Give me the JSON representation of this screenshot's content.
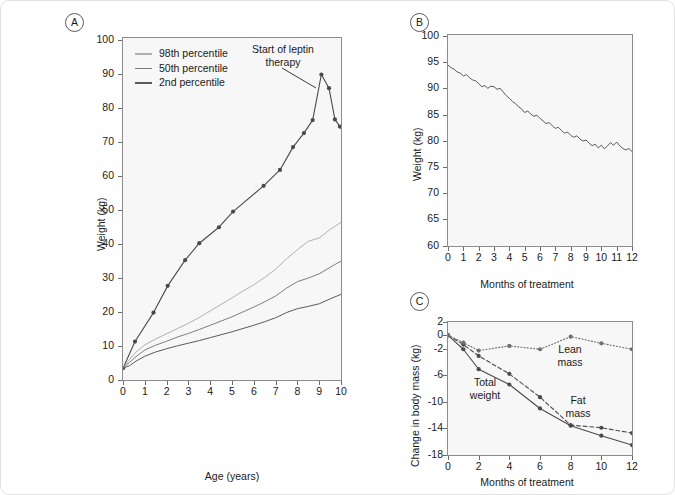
{
  "figure": {
    "background": "#ffffff",
    "plot_background": "#f7f7f7",
    "axis_color": "#8c8c8c",
    "series_dark_color": "#4a4a4a",
    "series_mid_color": "#7d7d7d",
    "series_light_color": "#b0b0b0"
  },
  "panels": {
    "a": {
      "tag": "A",
      "xlabel": "Age (years)",
      "ylabel": "Weight (kg)",
      "yticks": [
        "0",
        "10",
        "20",
        "30",
        "40",
        "50",
        "60",
        "70",
        "80",
        "90",
        "100"
      ],
      "xticks": [
        "0",
        "1",
        "2",
        "3",
        "4",
        "5",
        "6",
        "7",
        "8",
        "9",
        "10"
      ],
      "legend": [
        {
          "label": "98th percentile",
          "color": "#b0b0b0"
        },
        {
          "label": "50th percentile",
          "color": "#7d7d7d"
        },
        {
          "label": "2nd percentile",
          "color": "#5a5a5a"
        }
      ],
      "annotation": {
        "line1": "Start of leptin",
        "line2": "therapy"
      }
    },
    "b": {
      "tag": "B",
      "xlabel": "Months of treatment",
      "ylabel": "Weight (kg)",
      "yticks": [
        "60",
        "65",
        "70",
        "75",
        "80",
        "85",
        "90",
        "95",
        "100"
      ],
      "xticks": [
        "0",
        "1",
        "2",
        "3",
        "4",
        "5",
        "6",
        "7",
        "8",
        "9",
        "10",
        "11",
        "12"
      ]
    },
    "c": {
      "tag": "C",
      "xlabel": "Months of treatment",
      "ylabel": "Change in body mass (kg)",
      "yticks": [
        "-18",
        "-14",
        "-10",
        "-6",
        "-2",
        "0",
        "2"
      ],
      "xticks": [
        "0",
        "2",
        "4",
        "6",
        "8",
        "10",
        "12"
      ],
      "inline_labels": {
        "total_weight": {
          "line1": "Total",
          "line2": "weight"
        },
        "lean_mass": {
          "line1": "Lean",
          "line2": "mass"
        },
        "fat_mass": {
          "line1": "Fat",
          "line2": "mass"
        }
      }
    }
  },
  "chart_data": [
    {
      "type": "line",
      "panel": "A",
      "title": "",
      "xlabel": "Age (years)",
      "ylabel": "Weight (kg)",
      "xlim": [
        0,
        10
      ],
      "ylim": [
        0,
        105
      ],
      "grid": false,
      "legend_position": "top-left",
      "series": [
        {
          "name": "Patient weight",
          "color": "#4a4a4a",
          "markers": true,
          "style": "solid",
          "points": [
            [
              0.0,
              3.6
            ],
            [
              0.55,
              11.8
            ],
            [
              1.4,
              20.7
            ],
            [
              2.05,
              28.9
            ],
            [
              2.85,
              36.8
            ],
            [
              3.5,
              42.0
            ],
            [
              4.4,
              46.9
            ],
            [
              5.05,
              51.7
            ],
            [
              6.45,
              59.6
            ],
            [
              7.2,
              64.5
            ],
            [
              7.8,
              71.5
            ],
            [
              8.3,
              75.8
            ],
            [
              8.7,
              79.8
            ],
            [
              9.1,
              93.8
            ],
            [
              9.45,
              89.6
            ],
            [
              9.72,
              80.0
            ],
            [
              9.95,
              77.8
            ]
          ]
        },
        {
          "name": "98th percentile",
          "color": "#b0b0b0",
          "markers": false,
          "style": "solid",
          "points": [
            [
              0.0,
              3.6
            ],
            [
              0.3,
              6.3
            ],
            [
              0.6,
              8.6
            ],
            [
              1.0,
              10.8
            ],
            [
              1.5,
              12.6
            ],
            [
              2.0,
              14.2
            ],
            [
              2.5,
              15.8
            ],
            [
              3.0,
              17.4
            ],
            [
              3.5,
              19.2
            ],
            [
              4.0,
              21.2
            ],
            [
              4.5,
              23.2
            ],
            [
              5.0,
              25.2
            ],
            [
              5.5,
              27.3
            ],
            [
              6.0,
              29.2
            ],
            [
              6.5,
              31.5
            ],
            [
              7.0,
              34.0
            ],
            [
              7.5,
              37.2
            ],
            [
              8.0,
              40.0
            ],
            [
              8.5,
              42.6
            ],
            [
              9.0,
              43.6
            ],
            [
              9.5,
              46.2
            ],
            [
              10.0,
              48.4
            ]
          ]
        },
        {
          "name": "50th percentile",
          "color": "#7d7d7d",
          "markers": false,
          "style": "solid",
          "points": [
            [
              0.0,
              3.6
            ],
            [
              0.3,
              5.4
            ],
            [
              0.6,
              7.2
            ],
            [
              1.0,
              9.2
            ],
            [
              1.5,
              10.7
            ],
            [
              2.0,
              11.9
            ],
            [
              2.5,
              13.2
            ],
            [
              3.0,
              14.3
            ],
            [
              3.5,
              15.5
            ],
            [
              4.0,
              16.8
            ],
            [
              4.5,
              18.1
            ],
            [
              5.0,
              19.4
            ],
            [
              5.5,
              20.9
            ],
            [
              6.0,
              22.4
            ],
            [
              6.5,
              24.0
            ],
            [
              7.0,
              25.8
            ],
            [
              7.5,
              28.2
            ],
            [
              8.0,
              30.2
            ],
            [
              8.5,
              31.3
            ],
            [
              9.0,
              32.6
            ],
            [
              9.5,
              34.6
            ],
            [
              10.0,
              36.5
            ]
          ]
        },
        {
          "name": "2nd percentile",
          "color": "#5a5a5a",
          "markers": false,
          "style": "solid",
          "points": [
            [
              0.0,
              3.6
            ],
            [
              0.3,
              4.4
            ],
            [
              0.6,
              5.8
            ],
            [
              1.0,
              7.3
            ],
            [
              1.5,
              8.6
            ],
            [
              2.0,
              9.6
            ],
            [
              2.5,
              10.5
            ],
            [
              3.0,
              11.3
            ],
            [
              3.5,
              12.1
            ],
            [
              4.0,
              13.0
            ],
            [
              4.5,
              13.9
            ],
            [
              5.0,
              14.8
            ],
            [
              5.5,
              15.8
            ],
            [
              6.0,
              16.8
            ],
            [
              6.5,
              17.9
            ],
            [
              7.0,
              19.1
            ],
            [
              7.5,
              20.7
            ],
            [
              8.0,
              21.9
            ],
            [
              8.5,
              22.6
            ],
            [
              9.0,
              23.4
            ],
            [
              9.5,
              24.9
            ],
            [
              10.0,
              26.3
            ]
          ]
        }
      ],
      "annotations": [
        {
          "text": "Start of leptin therapy",
          "at": [
            9.1,
            93.8
          ]
        }
      ]
    },
    {
      "type": "line",
      "panel": "B",
      "title": "",
      "xlabel": "Months of treatment",
      "ylabel": "Weight (kg)",
      "xlim": [
        0,
        12
      ],
      "ylim": [
        60,
        100
      ],
      "grid": false,
      "series": [
        {
          "name": "Weight during leptin therapy",
          "color": "#5a5a5a",
          "markers": false,
          "style": "solid",
          "points": [
            [
              0.0,
              94.3
            ],
            [
              0.2,
              93.8
            ],
            [
              0.4,
              93.5
            ],
            [
              0.6,
              93.0
            ],
            [
              0.8,
              92.8
            ],
            [
              1.0,
              92.2
            ],
            [
              1.2,
              92.5
            ],
            [
              1.4,
              91.9
            ],
            [
              1.6,
              91.5
            ],
            [
              1.8,
              91.3
            ],
            [
              2.0,
              90.8
            ],
            [
              2.2,
              90.2
            ],
            [
              2.4,
              90.4
            ],
            [
              2.6,
              89.9
            ],
            [
              2.8,
              90.3
            ],
            [
              3.0,
              90.2
            ],
            [
              3.2,
              89.7
            ],
            [
              3.4,
              89.9
            ],
            [
              3.6,
              89.2
            ],
            [
              3.8,
              88.5
            ],
            [
              4.0,
              88.0
            ],
            [
              4.2,
              87.4
            ],
            [
              4.4,
              87.0
            ],
            [
              4.6,
              86.4
            ],
            [
              4.8,
              86.0
            ],
            [
              5.0,
              85.3
            ],
            [
              5.2,
              85.6
            ],
            [
              5.4,
              85.0
            ],
            [
              5.6,
              84.6
            ],
            [
              5.8,
              84.8
            ],
            [
              6.0,
              84.2
            ],
            [
              6.2,
              83.7
            ],
            [
              6.4,
              83.2
            ],
            [
              6.6,
              83.4
            ],
            [
              6.8,
              82.8
            ],
            [
              7.0,
              82.3
            ],
            [
              7.2,
              82.5
            ],
            [
              7.4,
              81.9
            ],
            [
              7.6,
              81.4
            ],
            [
              7.8,
              81.6
            ],
            [
              8.0,
              81.0
            ],
            [
              8.2,
              80.6
            ],
            [
              8.4,
              80.9
            ],
            [
              8.6,
              80.3
            ],
            [
              8.8,
              79.9
            ],
            [
              9.0,
              80.1
            ],
            [
              9.2,
              79.5
            ],
            [
              9.4,
              79.0
            ],
            [
              9.6,
              79.3
            ],
            [
              9.8,
              78.6
            ],
            [
              10.0,
              79.1
            ],
            [
              10.2,
              78.4
            ],
            [
              10.4,
              79.0
            ],
            [
              10.6,
              79.6
            ],
            [
              10.8,
              79.1
            ],
            [
              11.0,
              79.7
            ],
            [
              11.2,
              79.0
            ],
            [
              11.4,
              78.5
            ],
            [
              11.6,
              78.2
            ],
            [
              11.8,
              78.5
            ],
            [
              12.0,
              77.9
            ]
          ]
        }
      ]
    },
    {
      "type": "line",
      "panel": "C",
      "title": "",
      "xlabel": "Months of treatment",
      "ylabel": "Change in body mass (kg)",
      "xlim": [
        0,
        12
      ],
      "ylim": [
        -18,
        2
      ],
      "grid": false,
      "series": [
        {
          "name": "Total weight",
          "color": "#4a4a4a",
          "markers": true,
          "style": "solid",
          "points": [
            [
              0,
              0.0
            ],
            [
              1,
              -2.1
            ],
            [
              2,
              -5.1
            ],
            [
              4,
              -7.4
            ],
            [
              6,
              -11.0
            ],
            [
              8,
              -13.6
            ],
            [
              10,
              -15.1
            ],
            [
              12,
              -16.5
            ]
          ]
        },
        {
          "name": "Fat mass",
          "color": "#4a4a4a",
          "markers": true,
          "style": "dashed",
          "points": [
            [
              0,
              0.0
            ],
            [
              1,
              -1.4
            ],
            [
              2,
              -3.1
            ],
            [
              4,
              -5.8
            ],
            [
              6,
              -9.3
            ],
            [
              8,
              -13.5
            ],
            [
              10,
              -13.9
            ],
            [
              12,
              -14.7
            ]
          ]
        },
        {
          "name": "Lean mass",
          "color": "#6e6e6e",
          "markers": true,
          "style": "dotted",
          "points": [
            [
              0,
              0.0
            ],
            [
              1,
              -1.1
            ],
            [
              2,
              -2.3
            ],
            [
              4,
              -1.6
            ],
            [
              6,
              -2.1
            ],
            [
              8,
              -0.2
            ],
            [
              10,
              -1.2
            ],
            [
              12,
              -2.1
            ]
          ]
        }
      ]
    }
  ]
}
